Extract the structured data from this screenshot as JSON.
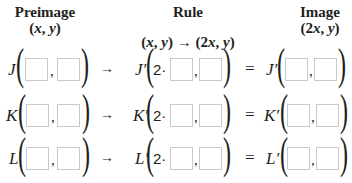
{
  "headers": {
    "preimage": {
      "title": "Preimage",
      "formula_open": "(",
      "x": "x",
      "sep": ", ",
      "y": "y",
      "formula_close": ")"
    },
    "rule": {
      "title": "Rule",
      "formula": "(x, y) → (2x, y)",
      "lhs_x": "x",
      "lhs_y": "y",
      "arrow": "→",
      "rhs_coef": "2",
      "rhs_x": "x",
      "rhs_y": "y"
    },
    "image": {
      "title": "Image",
      "coef": "2",
      "x": "x",
      "y": "y"
    }
  },
  "symbols": {
    "open_paren": "(",
    "close_paren": ")",
    "comma": ",",
    "arrow": "→",
    "equals": "=",
    "multiplier": "2·"
  },
  "rows": [
    {
      "point": "J",
      "image_point": "J′",
      "preimage_x": "",
      "preimage_y": "",
      "rule_x": "",
      "rule_y": "",
      "image_x": "",
      "image_y": ""
    },
    {
      "point": "K",
      "image_point": "K′",
      "preimage_x": "",
      "preimage_y": "",
      "rule_x": "",
      "rule_y": "",
      "image_x": "",
      "image_y": ""
    },
    {
      "point": "L",
      "image_point": "L′",
      "preimage_x": "",
      "preimage_y": "",
      "rule_x": "",
      "rule_y": "",
      "image_x": "",
      "image_y": ""
    }
  ]
}
